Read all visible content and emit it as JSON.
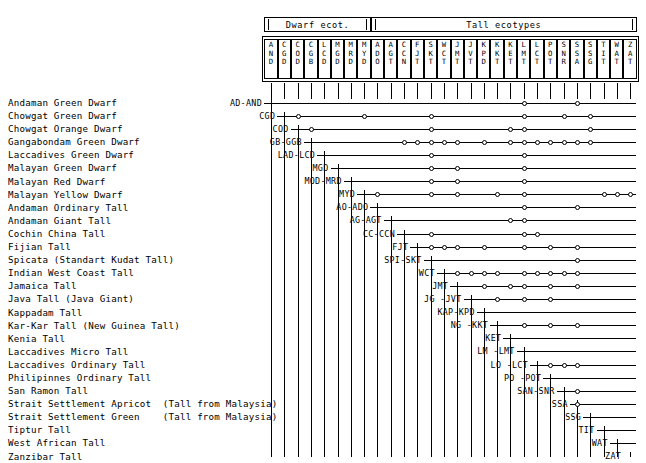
{
  "figure": {
    "title": "",
    "groups": [
      {
        "label": "Dwarf ecot.",
        "span": [
          0,
          8
        ]
      },
      {
        "label": "Tall ecotypes",
        "span": [
          8,
          28
        ]
      }
    ],
    "columns": [
      "AND",
      "CGD",
      "COD",
      "CGB",
      "LCD",
      "MGD",
      "MRD",
      "MYD",
      "ADO",
      "AGT",
      "CCN",
      "FJT",
      "SKT",
      "WCT",
      "JMT",
      "JVT",
      "KPD",
      "KKT",
      "KET",
      "LMT",
      "LCT",
      "POT",
      "SNR",
      "SSA",
      "SSG",
      "TIT",
      "WAT",
      "ZAT"
    ],
    "rows": [
      {
        "name": "Andaman Green Dwarf",
        "stub": "AD-AND",
        "nodes": [
          19,
          23
        ]
      },
      {
        "name": "Chowgat Green Dwarf",
        "stub": "CGD",
        "nodes": [
          2,
          7,
          12,
          19,
          22,
          24
        ]
      },
      {
        "name": "Chowgat Orange Dwarf",
        "stub": "COD",
        "nodes": [
          3,
          12,
          18,
          19,
          24
        ]
      },
      {
        "name": "Gangabondam Green Dwarf",
        "stub": "GB-GGB",
        "nodes": [
          10,
          11,
          12,
          13,
          14,
          16,
          18,
          19,
          20,
          21,
          22,
          23,
          24
        ]
      },
      {
        "name": "Laccadives Green Dwarf",
        "stub": "LAD-LCD",
        "nodes": [
          12,
          19
        ]
      },
      {
        "name": "Malayan Green Dwarf",
        "stub": "MGD",
        "nodes": [
          12,
          14,
          19
        ]
      },
      {
        "name": "Malayan Red Dwarf",
        "stub": "MOD-MRD",
        "nodes": [
          12,
          14,
          19
        ]
      },
      {
        "name": "Malayan Yellow Dwarf",
        "stub": "MYD",
        "nodes": [
          8,
          12,
          14,
          17,
          19,
          25,
          26,
          27
        ]
      },
      {
        "name": "Andaman Ordinary Tall",
        "stub": "AO-ADO",
        "nodes": [
          19,
          23
        ]
      },
      {
        "name": "Andaman Giant Tall",
        "stub": "AG-AGT",
        "nodes": [
          18,
          19
        ]
      },
      {
        "name": "Cochin China Tall",
        "stub": "CC-CCN",
        "nodes": [
          12,
          19,
          20
        ]
      },
      {
        "name": "Fijian Tall",
        "stub": "FJT",
        "nodes": [
          12,
          13,
          14,
          16,
          19,
          21,
          23
        ]
      },
      {
        "name": "Spicata (Standart Kudat Tall)",
        "stub": "SPI-SKT",
        "nodes": [
          23
        ]
      },
      {
        "name": "Indian West Coast Tall",
        "stub": "WCT",
        "nodes": [
          14,
          15,
          16,
          17,
          19,
          20,
          21,
          22,
          23
        ]
      },
      {
        "name": "Jamaica Tall",
        "stub": "JMT",
        "nodes": [
          16,
          18,
          19,
          21,
          23
        ]
      },
      {
        "name": "Java Tall (Java Giant)",
        "stub": "JG -JVT",
        "nodes": [
          17,
          19,
          21
        ]
      },
      {
        "name": "Kappadam Tall",
        "stub": "KAP-KPD",
        "nodes": []
      },
      {
        "name": "Kar-Kar Tall (New Guinea Tall)",
        "stub": "NG -KKT",
        "nodes": [
          19,
          21,
          23
        ]
      },
      {
        "name": "Kenia Tall",
        "stub": "KET",
        "nodes": []
      },
      {
        "name": "Laccadives Micro Tall",
        "stub": "LM -LMT",
        "nodes": []
      },
      {
        "name": "Laccadives Ordinary Tall",
        "stub": "LO -LCT",
        "nodes": [
          21,
          22,
          23
        ]
      },
      {
        "name": "Philipinnes Ordinary Tall",
        "stub": "PO -POT",
        "nodes": []
      },
      {
        "name": "San Ramon Tall",
        "stub": "SAN-SNR",
        "nodes": [
          23
        ]
      },
      {
        "name": "Strait Settlement Apricot  (Tall from Malaysia)",
        "stub": "SSA",
        "nodes": [
          23
        ]
      },
      {
        "name": "Strait Settlement Green    (Tall from Malaysia)",
        "stub": "SSG",
        "nodes": []
      },
      {
        "name": "Tiptur Tall",
        "stub": "TIT",
        "nodes": []
      },
      {
        "name": "West African Tall",
        "stub": "WAT",
        "nodes": []
      },
      {
        "name": "Zanzibar Tall",
        "stub": "ZAT",
        "nodes": []
      }
    ],
    "colors": {
      "line": "#000000",
      "background": "#ffffff",
      "node_fill": "#ffffff"
    }
  }
}
